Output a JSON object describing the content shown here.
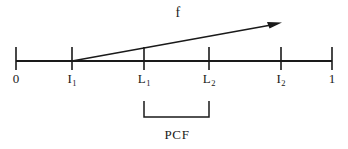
{
  "figure": {
    "name": "number-line-pcf-diagram",
    "width": 348,
    "height": 149,
    "background_color": "#ffffff",
    "stroke_color": "#1a1a1a"
  },
  "axis": {
    "name": "number-line",
    "y": 61,
    "x_start": 16,
    "x_end": 332,
    "tick_top": 47,
    "tick_bottom": 70,
    "ticks": [
      {
        "id": "tick-0",
        "x": 16,
        "label_text": "0",
        "label_sub": ""
      },
      {
        "id": "tick-i1",
        "x": 72,
        "label_text": "I",
        "label_sub": "1"
      },
      {
        "id": "tick-l1",
        "x": 144,
        "label_text": "L",
        "label_sub": "1"
      },
      {
        "id": "tick-l2",
        "x": 209,
        "label_text": "L",
        "label_sub": "2"
      },
      {
        "id": "tick-i2",
        "x": 281,
        "label_text": "I",
        "label_sub": "2"
      },
      {
        "id": "tick-1",
        "x": 332,
        "label_text": "1",
        "label_sub": ""
      }
    ]
  },
  "arrow": {
    "name": "function-arrow",
    "label": "f",
    "label_x": 178,
    "label_y": 6,
    "x1": 72,
    "y1": 61,
    "x2": 281,
    "y2": 23
  },
  "bracket": {
    "name": "pcf-bracket",
    "label": "PCF",
    "label_x": 177,
    "left_x": 144,
    "right_x": 209,
    "top_y": 101,
    "bottom_y": 117
  }
}
